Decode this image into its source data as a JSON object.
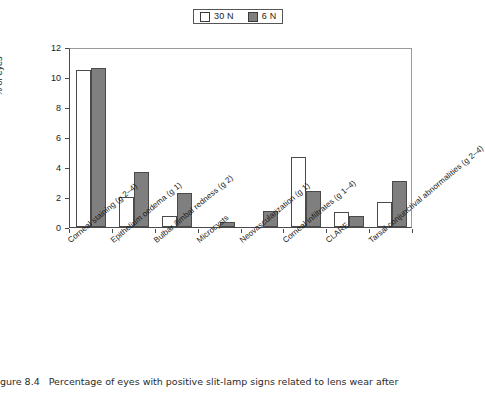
{
  "figure": {
    "number_text": "gure 8.4",
    "caption_text": "Percentage of eyes with positive slit-lamp signs related to lens wear after"
  },
  "legend": {
    "position": "top-center",
    "entries": [
      {
        "label": "30 N",
        "color": "#ffffff",
        "swatch": "white-square-icon"
      },
      {
        "label": "6 N",
        "color": "#7f7f7f",
        "swatch": "gray-square-icon"
      }
    ]
  },
  "axes": {
    "ylabel": "% of eyes",
    "yticks": [
      "0",
      "2",
      "4",
      "6",
      "8",
      "10",
      "12"
    ],
    "ylim": [
      0,
      12
    ],
    "grid": false
  },
  "chart_data": {
    "type": "bar",
    "title": "",
    "xlabel": "",
    "ylabel": "% of eyes",
    "ylim": [
      0,
      12
    ],
    "grid": false,
    "legend_position": "top-center",
    "categories": [
      "Corneal staining (g 2–4)",
      "Epithelium oedema (g 1)",
      "Bulbar /limbal redness (g 2)",
      "Microcysts",
      "Neovascularization (g 1)",
      "Corneal infiltrates (g 1–4)",
      "CLARE",
      "Tarsal conjunctival abnormalities (g 2–4)"
    ],
    "series": [
      {
        "name": "30 N",
        "color": "#ffffff",
        "values": [
          10.5,
          2.0,
          0.75,
          0.0,
          0.0,
          4.65,
          1.0,
          1.7
        ]
      },
      {
        "name": "6 N",
        "color": "#7f7f7f",
        "values": [
          10.6,
          3.65,
          2.3,
          0.35,
          1.1,
          2.4,
          0.75,
          3.05
        ]
      }
    ]
  }
}
